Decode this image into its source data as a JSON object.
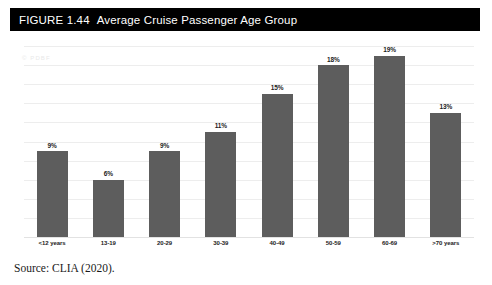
{
  "figure": {
    "number": "FIGURE 1.44",
    "title": "Average Cruise Passenger Age Group",
    "banner_color": "#000000",
    "banner_text_color": "#ffffff",
    "watermark": "© PDBF",
    "source": "Source: CLIA (2020)."
  },
  "chart_data": {
    "type": "bar",
    "title": "Average Cruise Passenger Age Group",
    "xlabel": "",
    "ylabel": "",
    "categories": [
      "<12 years",
      "13-19",
      "20-29",
      "30-39",
      "40-49",
      "50-59",
      "60-69",
      ">70 years"
    ],
    "values": [
      9,
      6,
      9,
      11,
      15,
      18,
      19,
      13
    ],
    "data_labels": [
      "9%",
      "6%",
      "9%",
      "11%",
      "15%",
      "18%",
      "19%",
      "13%"
    ],
    "ylim": [
      0,
      20
    ],
    "gridlines": 10,
    "grid": true,
    "legend": false,
    "bar_color": "#5d5d5d",
    "gridline_color": "#ededed",
    "unit": "%"
  }
}
